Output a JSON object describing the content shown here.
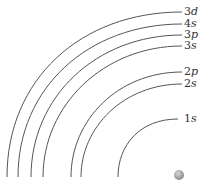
{
  "diagram": {
    "title": "",
    "shells": [
      {
        "id": "3d",
        "n": "3",
        "l": "d",
        "label": "3d",
        "x0": 7,
        "y1": 12
      },
      {
        "id": "4s",
        "n": "4",
        "l": "s",
        "label": "4s",
        "x0": 18,
        "y1": 24
      },
      {
        "id": "3p",
        "n": "3",
        "l": "p",
        "label": "3p",
        "x0": 31,
        "y1": 35
      },
      {
        "id": "3s",
        "n": "3",
        "l": "s",
        "label": "3s",
        "x0": 43,
        "y1": 46
      },
      {
        "id": "2p",
        "n": "2",
        "l": "p",
        "label": "2p",
        "x0": 71,
        "y1": 72
      },
      {
        "id": "2s",
        "n": "2",
        "l": "s",
        "label": "2s",
        "x0": 81,
        "y1": 84
      },
      {
        "id": "1s",
        "n": "1",
        "l": "s",
        "label": "1s",
        "x0": 118,
        "y1": 119
      }
    ],
    "nucleus": {
      "label": "nucleus",
      "color": "#a8a8a8"
    },
    "line_color": "#555555"
  }
}
